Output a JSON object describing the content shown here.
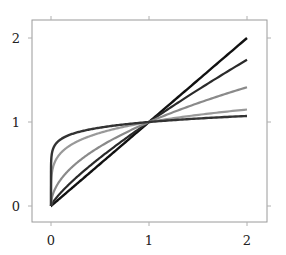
{
  "chart_data": {
    "type": "line",
    "title": "",
    "xlabel": "",
    "ylabel": "",
    "xlim": [
      -0.2,
      2.2
    ],
    "ylim": [
      -0.19,
      2.2
    ],
    "xticks": [
      0,
      1,
      2
    ],
    "yticks": [
      0,
      1,
      2
    ],
    "xtick_labels": [
      "0",
      "1",
      "2"
    ],
    "ytick_labels": [
      "0",
      "1",
      "2"
    ],
    "grid": false,
    "legend": null,
    "series": [
      {
        "name": "x^1",
        "exponent": 1.0,
        "color": "#111111",
        "width": 2.4,
        "x": [
          0,
          2
        ],
        "y_end": 2.0
      },
      {
        "name": "x^0.8",
        "exponent": 0.8,
        "color": "#2a2a2a",
        "width": 2.2,
        "x": [
          0,
          2
        ],
        "y_end": 1.74
      },
      {
        "name": "x^0.5",
        "exponent": 0.5,
        "color": "#8a8a8a",
        "width": 2.2,
        "x": [
          0,
          2
        ],
        "y_end": 1.41
      },
      {
        "name": "x^0.2",
        "exponent": 0.2,
        "color": "#999999",
        "width": 2.2,
        "x": [
          0,
          2
        ],
        "y_end": 1.15
      },
      {
        "name": "x^0.1",
        "exponent": 0.1,
        "color": "#333333",
        "width": 2.4,
        "x": [
          0,
          2
        ],
        "y_end": 1.07
      }
    ]
  }
}
